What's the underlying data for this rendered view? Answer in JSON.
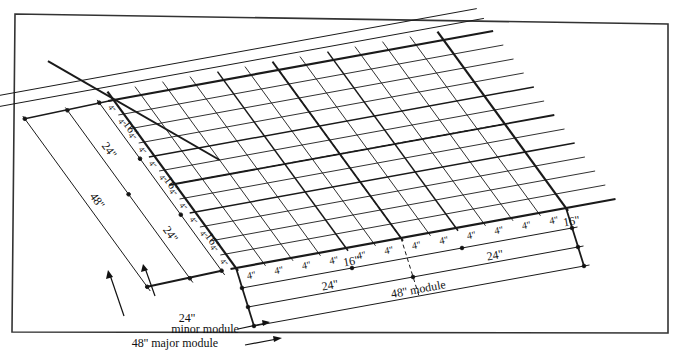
{
  "figure": {
    "type": "modular planning grid (isometric view)",
    "colors": {
      "line": "#1a1a1a",
      "background": "#ffffff",
      "frame": "#333333"
    }
  },
  "grid": {
    "fine_spacing_label": "4''",
    "row_labels_left": [
      "4''",
      "4''",
      "4''",
      "4''",
      "4''",
      "4''",
      "4''",
      "4''",
      "4''",
      "4''",
      "4''",
      "4''"
    ],
    "front_edge_labels": [
      "4''",
      "4''",
      "4''",
      "4''",
      "4''",
      "4''",
      "4''",
      "4''",
      "4''",
      "4''",
      "4''",
      "4''"
    ]
  },
  "left_dimensions": {
    "inner": [
      "16''",
      "16''",
      "16''"
    ],
    "middle": [
      "24''",
      "24''"
    ],
    "outer": [
      "48''"
    ]
  },
  "front_dimensions": {
    "row1": [
      "16''",
      "16''"
    ],
    "row2": [
      "24''",
      "24''"
    ],
    "row3": [
      "48'' module"
    ]
  },
  "legend": {
    "minor_value": "24''",
    "minor_label": "minor module",
    "major_label": "48'' major module"
  }
}
